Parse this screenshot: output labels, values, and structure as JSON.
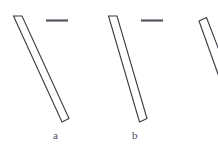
{
  "figure": {
    "background_color": "#ffffff",
    "width": 218,
    "height": 160,
    "stroke_color": "#3a3a42",
    "dash_color": "#55555e"
  },
  "panels": [
    {
      "id": "panel-a",
      "label": "a",
      "label_x": 53,
      "label_y": 130,
      "shape_name": "elongated-strip-a",
      "shape_points": "13.5,16 22,16 69,118.5 62,122",
      "has_scale_bar": true,
      "scale_bar": {
        "x1": 46,
        "y1": 20.5,
        "x2": 68,
        "y2": 20.5
      }
    },
    {
      "id": "panel-b",
      "label": "b",
      "label_x": 132,
      "label_y": 130,
      "shape_name": "elongated-strip-b",
      "shape_points": "108.5,16 117,16 147,118.5 139.5,122",
      "has_scale_bar": true,
      "scale_bar": {
        "x1": 141,
        "y1": 20.5,
        "x2": 163,
        "y2": 20.5
      }
    },
    {
      "id": "panel-c",
      "label": "",
      "shape_name": "elongated-strip-c-cropped",
      "shape_points": "199,21 206.5,17.5 222,58 218,74",
      "has_scale_bar": false,
      "scale_bar": null
    }
  ]
}
